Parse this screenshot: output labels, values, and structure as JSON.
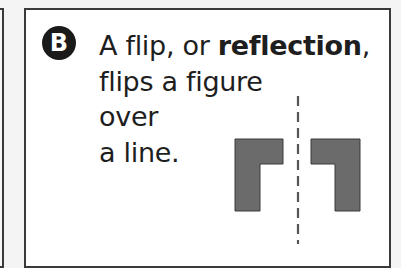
{
  "card": {
    "badge_label": "B",
    "text_line1_pre": "A flip, or ",
    "text_line1_bold": "reflection",
    "text_line1_post": ",",
    "text_line2": "flips a figure",
    "text_line3": "over",
    "text_line4": "a line."
  },
  "figure": {
    "shape_color": "#6b6b6b",
    "shape_stroke": "#3a3a3a",
    "axis_color": "#555555"
  }
}
